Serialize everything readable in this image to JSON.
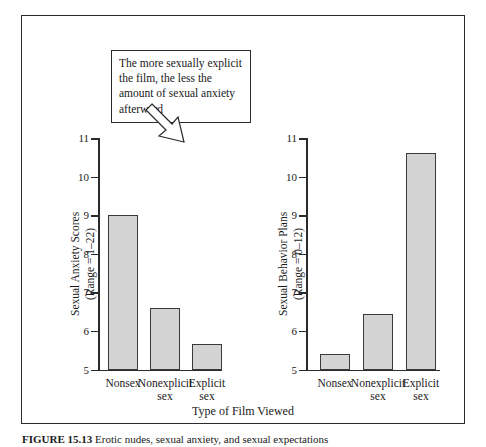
{
  "figure": {
    "caption_number": "FIGURE 15.13",
    "caption_text": "Erotic nudes, sexual anxiety, and sexual expectations",
    "xaxis_title": "Type of Film Viewed"
  },
  "callouts": {
    "left": "The more sexually explicit the film, the less the amount of sexual anxiety afterward",
    "right": "The more sexually explicit the film, the more sexual acts the viewers expected to experience in the near future"
  },
  "chart_data": [
    {
      "type": "bar",
      "title": "",
      "panel": "left",
      "ylabel": "Sexual Anxiety Scores",
      "ylabel_line2": "(Range = 1–22)",
      "xlabel": "Type of Film Viewed",
      "categories": [
        "Nonsex",
        "Nonexplicit sex",
        "Explicit sex"
      ],
      "category_lines": [
        [
          "Nonsex"
        ],
        [
          "Nonexplicit",
          "sex"
        ],
        [
          "Explicit",
          "sex"
        ]
      ],
      "values": [
        9.0,
        6.6,
        5.65
      ],
      "ylim": [
        5,
        11
      ],
      "yticks": [
        5,
        6,
        7,
        8,
        9,
        10,
        11
      ],
      "ytick_labels": [
        "5",
        "6",
        "7",
        "8",
        "9",
        "10",
        "11"
      ],
      "grid": false,
      "legend": "none",
      "bar_color": "#d3d3d3",
      "bar_edge_color": "#3a3a3a"
    },
    {
      "type": "bar",
      "title": "",
      "panel": "right",
      "ylabel": "Sexual Behavior Plans",
      "ylabel_line2": "(Range = 0–12)",
      "xlabel": "Type of Film Viewed",
      "categories": [
        "Nonsex",
        "Nonexplicit sex",
        "Explicit sex"
      ],
      "category_lines": [
        [
          "Nonsex"
        ],
        [
          "Nonexplicit",
          "sex"
        ],
        [
          "Explicit",
          "sex"
        ]
      ],
      "values": [
        5.4,
        6.45,
        10.6
      ],
      "ylim": [
        5,
        11
      ],
      "yticks": [
        5,
        6,
        7,
        8,
        9,
        10,
        11
      ],
      "ytick_labels": [
        "5",
        "6",
        "7",
        "8",
        "9",
        "10",
        "11"
      ],
      "grid": false,
      "legend": "none",
      "bar_color": "#d3d3d3",
      "bar_edge_color": "#3a3a3a"
    }
  ]
}
